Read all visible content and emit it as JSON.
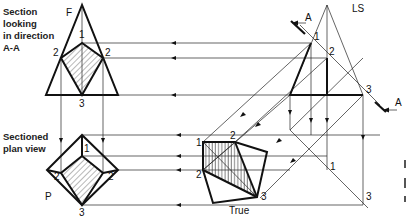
{
  "captions": {
    "front_line1": "Section",
    "front_line2": "looking",
    "front_line3": "in direction",
    "front_line4": "A-A",
    "plan_line1": "Sectioned",
    "plan_line2": "plan view"
  },
  "view_labels": {
    "front": "F",
    "side": "LS",
    "plan": "P",
    "true_shape": "True"
  },
  "cutting_plane": {
    "label_top": "A",
    "label_bottom": "A"
  },
  "points": {
    "front": {
      "p1": "1",
      "p2_left": "2",
      "p2_right": "2",
      "p3": "3"
    },
    "plan": {
      "p1": "1",
      "p2_left": "2",
      "p2_right": "2",
      "p3": "3"
    },
    "side": {
      "p1": "1",
      "p2": "2",
      "p3": "3"
    },
    "true_shape": {
      "p1": "1",
      "p2_top": "2",
      "p2_left": "2",
      "p3": "3"
    },
    "fold_line": {
      "p1": "1",
      "p3": "3"
    }
  },
  "colors": {
    "line": "#111111",
    "background": "#ffffff"
  }
}
